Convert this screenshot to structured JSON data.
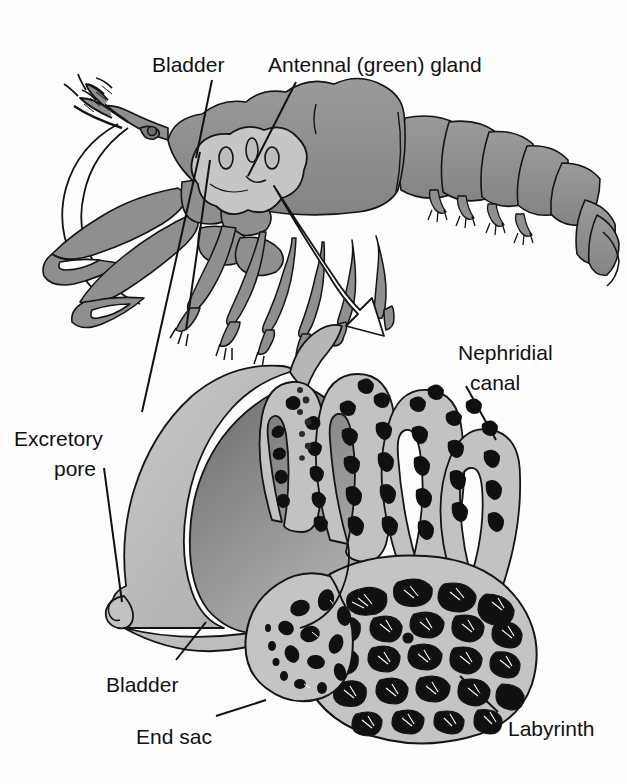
{
  "figure": {
    "width": 627,
    "height": 784,
    "background": "#fdfdfd"
  },
  "palette": {
    "outline": "#141414",
    "body_gray": "#8f8f8f",
    "body_gray_dark": "#7a7a7a",
    "gland_light": "#c6c6c6",
    "tissue_light": "#c9c9c9",
    "tissue_mid": "#a8a8a8",
    "lumen_black": "#101010",
    "bladder_wall": "#b9b9b9",
    "bladder_cavity_dark": "#6f6f6f",
    "arrow_fill": "#ffffff",
    "label_text": "#111111",
    "page_white": "#fdfdfd"
  },
  "labels": {
    "bladder_top": "Bladder",
    "antennal_gland": "Antennal (green) gland",
    "excretory_pore_line1": "Excretory",
    "excretory_pore_line2": "pore",
    "nephridial_line1": "Nephridial",
    "nephridial_line2": "canal",
    "bladder_bottom": "Bladder",
    "end_sac": "End sac",
    "labyrinth": "Labyrinth"
  },
  "parts": {
    "organism": "crayfish-lateral-view",
    "upper_panel": "whole-animal-with-gland-highlighted",
    "lower_panel": "antennal-gland-detail-section",
    "magnify_arrow": "curved-white-arrow-from-gland-to-detail",
    "structures": [
      "bladder",
      "antennal-gland",
      "excretory-pore",
      "nephridial-canal",
      "end-sac",
      "labyrinth"
    ]
  }
}
